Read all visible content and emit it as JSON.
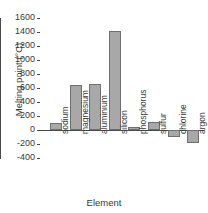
{
  "chart_data": {
    "type": "bar",
    "title": "",
    "xlabel": "Element",
    "ylabel": "Melting point (°C)",
    "categories": [
      "sodium",
      "magnesium",
      "aluminium",
      "silicon",
      "phosphorus",
      "sulfur",
      "chlorine",
      "argon"
    ],
    "values": [
      98,
      650,
      660,
      1410,
      44,
      113,
      -101,
      -189
    ],
    "ylim": [
      -400,
      1600
    ],
    "yticks": [
      -400,
      -200,
      0,
      200,
      400,
      600,
      800,
      1000,
      1200,
      1400,
      1600
    ],
    "ytick_labels": [
      "-400",
      "-200",
      "0",
      "200",
      "400",
      "600",
      "800",
      "1000",
      "1200",
      "1400",
      "1600"
    ],
    "grid": false,
    "legend": false,
    "bar_fill": "#a8a8a8",
    "bar_edge": "#6f6f6f",
    "axis_color": "#4a4a4a",
    "background": "#ffffff"
  }
}
